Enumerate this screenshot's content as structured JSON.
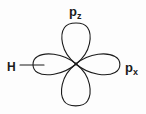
{
  "figure": {
    "background_color": "#fdfdfd",
    "stroke_color": "#1b1b1b",
    "stroke_width": 1.1
  },
  "labels": {
    "pz": {
      "base": "p",
      "sub": "z",
      "name": "p-z orbital label"
    },
    "px": {
      "base": "p",
      "sub": "x",
      "name": "p-x orbital label"
    },
    "h": {
      "base": "H",
      "name": "hydrogen atom label"
    }
  },
  "geometry": {
    "center": {
      "x": 76,
      "y": 64
    },
    "lobes": [
      {
        "name": "pz-upper-lobe",
        "direction": "up",
        "tip_y": 22,
        "half_width": 13
      },
      {
        "name": "pz-lower-lobe",
        "direction": "down",
        "tip_y": 107,
        "half_width": 13
      },
      {
        "name": "px-right-lobe",
        "direction": "right",
        "tip_x": 121,
        "half_width": 11
      },
      {
        "name": "px-left-lobe",
        "direction": "left",
        "tip_x": 33,
        "half_width": 11
      }
    ],
    "bond": {
      "name": "h-bond-line",
      "x1": 20,
      "y1": 65,
      "x2": 42,
      "y2": 65
    }
  }
}
